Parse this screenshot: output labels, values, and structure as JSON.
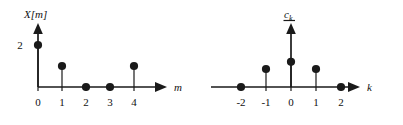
{
  "figure": {
    "background_color": "#ffffff",
    "ink_color": "#1a1a1a",
    "plots": [
      {
        "id": "left-plot",
        "name": "discrete-sequence-X-of-m",
        "ylabel": "X[m]",
        "xlabel": "m",
        "y_value_label": "2",
        "x_tick_labels": [
          "0",
          "1",
          "2",
          "3",
          "4"
        ]
      },
      {
        "id": "right-plot",
        "name": "fourier-coefficients-c-k",
        "ylabel": "c",
        "ylabel_subscript": "k",
        "xlabel": "k",
        "x_tick_labels": [
          "-2",
          "-1",
          "0",
          "1",
          "2"
        ]
      }
    ]
  },
  "chart_data": [
    {
      "type": "stem",
      "id": "left-plot",
      "title": "",
      "xlabel": "m",
      "ylabel": "X[m]",
      "x": [
        0,
        1,
        2,
        3,
        4
      ],
      "values": [
        2,
        1,
        0,
        0,
        1
      ],
      "x_tick_labels": [
        "0",
        "1",
        "2",
        "3",
        "4"
      ],
      "y_tick_labels": [
        "2"
      ],
      "y_ticks": [
        2
      ],
      "xlim": [
        -0.6,
        5.6
      ],
      "ylim": [
        0,
        2.6
      ],
      "grid": false,
      "legend": "none",
      "annotations": [
        "2"
      ]
    },
    {
      "type": "stem",
      "id": "right-plot",
      "title": "",
      "xlabel": "k",
      "ylabel": "c_k",
      "x": [
        -2,
        -1,
        0,
        1,
        2
      ],
      "values": [
        0,
        1,
        1.4,
        1,
        0
      ],
      "x_tick_labels": [
        "-2",
        "-1",
        "0",
        "1",
        "2"
      ],
      "y_tick_labels": [],
      "xlim": [
        -2.9,
        3.4
      ],
      "ylim": [
        0,
        2.2
      ],
      "grid": false,
      "legend": "none",
      "annotations": []
    }
  ]
}
